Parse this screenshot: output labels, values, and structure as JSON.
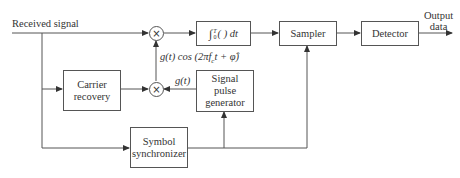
{
  "diagram": {
    "type": "block-diagram",
    "input_label": "Received signal",
    "output_label_line1": "Output",
    "output_label_line2": "data",
    "blocks": {
      "integrator": "∫₀ᵀ ( ) dt",
      "integrator_parts": {
        "sym": "∫",
        "sup": "T",
        "sub": "0",
        "body": "( ) dt"
      },
      "sampler": "Sampler",
      "detector": "Detector",
      "carrier_recovery_line1": "Carrier",
      "carrier_recovery_line2": "recovery",
      "signal_pulse_line1": "Signal",
      "signal_pulse_line2": "pulse",
      "signal_pulse_line3": "generator",
      "symbol_sync_line1": "Symbol",
      "symbol_sync_line2": "synchronizer"
    },
    "multiplier_symbol": "×",
    "signal_labels": {
      "reference": "g(t) cos (2πf",
      "reference_sub": "c",
      "reference_tail": "t + φ̂)",
      "pulse": "g(t)"
    },
    "connections": [
      [
        "Received signal",
        "top-multiplier"
      ],
      [
        "Received signal",
        "Carrier recovery"
      ],
      [
        "Received signal",
        "Symbol synchronizer"
      ],
      [
        "Carrier recovery",
        "bottom-multiplier"
      ],
      [
        "Signal pulse generator",
        "bottom-multiplier"
      ],
      [
        "bottom-multiplier",
        "top-multiplier"
      ],
      [
        "top-multiplier",
        "integrator"
      ],
      [
        "integrator",
        "Sampler"
      ],
      [
        "Sampler",
        "Detector"
      ],
      [
        "Detector",
        "Output data"
      ],
      [
        "Symbol synchronizer",
        "Signal pulse generator"
      ],
      [
        "Symbol synchronizer",
        "Sampler"
      ]
    ]
  }
}
